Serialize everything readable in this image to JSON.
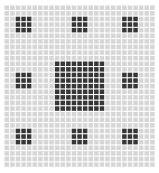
{
  "figure": {
    "canvas": {
      "width": 159,
      "height": 173,
      "background_color": "#ffffff"
    }
  },
  "chart_data": {
    "type": "heatmap",
    "title": "",
    "xlabel": "",
    "ylabel": "",
    "grid": true,
    "legend_position": "none",
    "colors": {
      "background_cell": "#d6d6d6",
      "dark_cell": "#363636",
      "gridline": "#ffffff",
      "page_background": "#ffffff"
    },
    "geometry": {
      "origin_x": 4,
      "origin_y": 5,
      "cell_size": 5.6,
      "columns": 27,
      "rows": 29
    },
    "categories": [],
    "values": [],
    "blocks": [
      {
        "name": "block-top-left",
        "col": 2,
        "row": 2,
        "cols": 3,
        "rows": 3,
        "value": 1
      },
      {
        "name": "block-top-center",
        "col": 12,
        "row": 2,
        "cols": 3,
        "rows": 3,
        "value": 1
      },
      {
        "name": "block-top-right",
        "col": 21,
        "row": 2,
        "cols": 3,
        "rows": 3,
        "value": 1
      },
      {
        "name": "block-middle-left",
        "col": 2,
        "row": 12,
        "cols": 3,
        "rows": 3,
        "value": 1
      },
      {
        "name": "block-center",
        "col": 9,
        "row": 10,
        "cols": 9,
        "rows": 9,
        "value": 1
      },
      {
        "name": "block-middle-right",
        "col": 21,
        "row": 12,
        "cols": 3,
        "rows": 3,
        "value": 1
      },
      {
        "name": "block-bottom-left",
        "col": 2,
        "row": 22,
        "cols": 3,
        "rows": 3,
        "value": 1
      },
      {
        "name": "block-bottom-center",
        "col": 12,
        "row": 22,
        "cols": 3,
        "rows": 3,
        "value": 1
      },
      {
        "name": "block-bottom-right",
        "col": 21,
        "row": 22,
        "cols": 3,
        "rows": 3,
        "value": 1
      }
    ]
  }
}
